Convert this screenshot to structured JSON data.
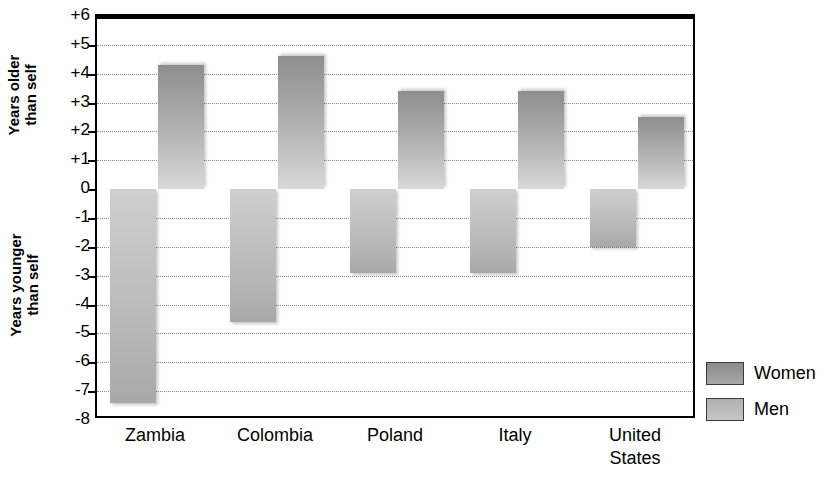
{
  "chart_data": {
    "type": "bar",
    "title": "",
    "xlabel": "",
    "ylabel_upper": "Years older\nthan self",
    "ylabel_lower": "Years younger\nthan self",
    "categories": [
      "Zambia",
      "Colombia",
      "Poland",
      "Italy",
      "United\nStates"
    ],
    "series": [
      {
        "name": "Women",
        "values": [
          -7.4,
          -4.6,
          -2.9,
          -2.9,
          -2.0
        ],
        "color": "#a6a6a6"
      },
      {
        "name": "Men",
        "values": [
          4.3,
          4.6,
          3.4,
          3.4,
          2.5
        ],
        "color": "#bdbdbd"
      }
    ],
    "ylim": [
      -8,
      6
    ],
    "yticks": [
      6,
      5,
      4,
      3,
      2,
      1,
      0,
      -1,
      -2,
      -3,
      -4,
      -5,
      -6,
      -7,
      -8
    ],
    "ytick_labels": [
      "+6",
      "+5",
      "+4",
      "+3",
      "+2",
      "+1",
      "0",
      "-1",
      "-2",
      "-3",
      "-4",
      "-5",
      "-6",
      "-7",
      "-8"
    ],
    "grid": true,
    "zero_line": 0,
    "legend_position": "right-bottom",
    "legend": [
      "Women",
      "Men"
    ]
  }
}
